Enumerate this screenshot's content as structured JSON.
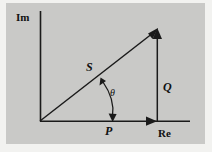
{
  "figure": {
    "type": "phasor-diagram",
    "background_color": "#c9c9c7",
    "mat_color": "#f2f2f0",
    "ink_color": "#1a1a1a",
    "axes": {
      "vertical_label": "Im",
      "horizontal_label": "Re",
      "origin": {
        "x": 40,
        "y": 121
      },
      "vertical_top": {
        "x": 40,
        "y": 11
      },
      "horizontal_right": {
        "x": 190,
        "y": 121
      }
    },
    "vectors": [
      {
        "name": "S",
        "label": "S",
        "meaning": "apparent-power-vector",
        "from": {
          "x": 40,
          "y": 121
        },
        "to": {
          "x": 157,
          "y": 30
        },
        "arrowhead": true
      },
      {
        "name": "P",
        "label": "P",
        "meaning": "real-power-vector",
        "from": {
          "x": 40,
          "y": 121
        },
        "to": {
          "x": 156,
          "y": 121
        },
        "arrowhead": true
      },
      {
        "name": "Q",
        "label": "Q",
        "meaning": "reactive-power-vector",
        "from": {
          "x": 157,
          "y": 121
        },
        "to": {
          "x": 157,
          "y": 30
        },
        "arrowhead": true
      }
    ],
    "angle": {
      "label": "θ",
      "meaning": "power-factor-angle",
      "between": [
        "Re",
        "S"
      ],
      "arc_start": {
        "x": 101,
        "y": 79
      },
      "arc_end": {
        "x": 113,
        "y": 121
      },
      "double_headed": true
    }
  }
}
